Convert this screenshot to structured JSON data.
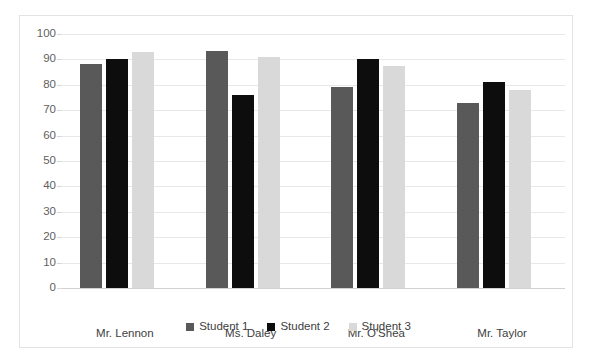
{
  "figure": {
    "scan_artifact_text": "",
    "background_color": "#ffffff",
    "frame_color": "#e3e3e3"
  },
  "chart_data": {
    "type": "bar",
    "title": "",
    "subtitle": "",
    "xlabel": "",
    "ylabel": "",
    "categories": [
      "Mr. Lennon",
      "Ms. Daley",
      "Mr. O'Shea",
      "Mr. Taylor"
    ],
    "series": [
      {
        "name": "Student 1",
        "color": "#595959",
        "values": [
          88,
          93.5,
          79,
          73
        ]
      },
      {
        "name": "Student 2",
        "color": "#0d0d0d",
        "values": [
          90,
          76,
          90,
          81
        ]
      },
      {
        "name": "Student 3",
        "color": "#d9d9d9",
        "values": [
          93,
          91,
          87.5,
          78
        ]
      }
    ],
    "ylim": [
      0,
      100
    ],
    "ytick_labels": [
      "100",
      "90",
      "80",
      "70",
      "60",
      "50",
      "40",
      "30",
      "20",
      "10",
      "0"
    ],
    "ytick_values": [
      100,
      90,
      80,
      70,
      60,
      50,
      40,
      30,
      20,
      10,
      0
    ],
    "grid": true,
    "grid_color": "#e8e8e8",
    "axis_color": "#d2d2d2",
    "legend_position": "bottom",
    "legend": [
      "Student 1",
      "Student 2",
      "Student 3"
    ],
    "bar_orientation": "vertical",
    "grouped": true
  }
}
